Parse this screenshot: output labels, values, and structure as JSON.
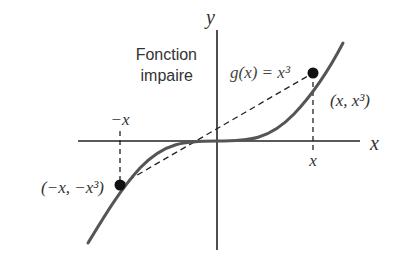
{
  "figure": {
    "caption_line1": "Fonction",
    "caption_line2": "impaire",
    "function_label": "g(x) = x³",
    "axis_labels": {
      "x": "x",
      "y": "y"
    },
    "tick_labels": {
      "neg_x": "−x",
      "pos_x": "x"
    },
    "points": {
      "positive": "(x, x³)",
      "negative": "(−x, −x³)"
    },
    "colors": {
      "curve": "#555555",
      "axes": "#222222",
      "points": "#111111",
      "text": "#333333"
    }
  }
}
